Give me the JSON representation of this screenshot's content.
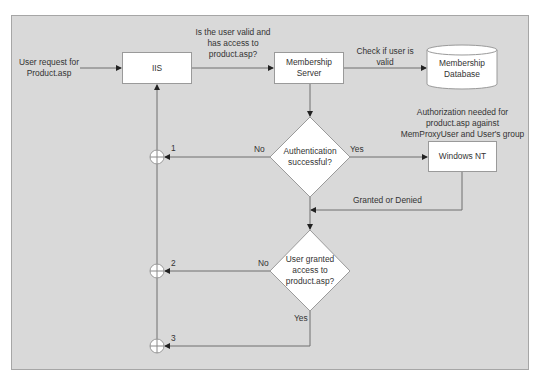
{
  "diagram": {
    "type": "flowchart",
    "colors": {
      "panel_bg": "#d9d9d9",
      "node_fill": "#ffffff",
      "line": "#6e6e6e",
      "text": "#333333"
    },
    "nodes": {
      "user_request": {
        "label_line1": "User request for",
        "label_line2": "Product.asp"
      },
      "iis": {
        "label": "IIS"
      },
      "membership_server": {
        "label_line1": "Membership",
        "label_line2": "Server"
      },
      "membership_database": {
        "label_line1": "Membership",
        "label_line2": "Database"
      },
      "windows_nt": {
        "label": "Windows NT"
      },
      "decision_auth": {
        "label_line1": "Authentication",
        "label_line2": "successful?"
      },
      "decision_access": {
        "label_line1": "User granted",
        "label_line2": "access to",
        "label_line3": "product.asp?"
      }
    },
    "edge_labels": {
      "iis_to_membership_1": "Is the user valid and",
      "iis_to_membership_2": "has access to",
      "iis_to_membership_3": "product.asp?",
      "membership_to_db_1": "Check if user is",
      "membership_to_db_2": "valid",
      "auth_needed_1": "Authorization needed for",
      "auth_needed_2": "product.asp against",
      "auth_needed_3": "MemProxyUser and User's group",
      "auth_no": "No",
      "auth_yes": "Yes",
      "granted_or_denied": "Granted or Denied",
      "access_no": "No",
      "access_yes": "Yes"
    },
    "junctions": [
      {
        "label": "1"
      },
      {
        "label": "2"
      },
      {
        "label": "3"
      }
    ]
  }
}
